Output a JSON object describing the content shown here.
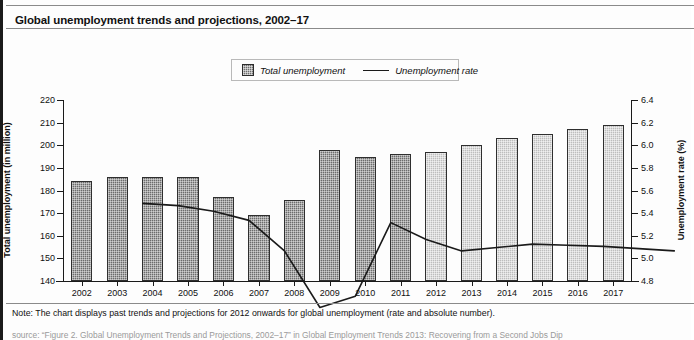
{
  "chart_title": "Global unemployment trends and projections, 2002–17",
  "legend": {
    "bar_label": "Total unemployment",
    "line_label": "Unemployment rate"
  },
  "footer": {
    "note": "Note: The chart displays past trends and projections for 2012 onwards for global unemployment (rate and absolute number).",
    "source": "source: “Figure 2. Global Unemployment Trends and Projections, 2002–17” in Global Employment Trends 2013: Recovering from a Second Jobs Dip"
  },
  "colors": {
    "bar_past": "#6c6c6c",
    "bar_projection": "#bdbdbd",
    "line": "#1a1a1a",
    "axis": "#1a1a1a",
    "title_text": "#111111"
  },
  "chart_data": {
    "type": "bar",
    "title": "Global unemployment trends and projections, 2002–17",
    "xlabel": "",
    "ylabel": "Total unemployment (in million)",
    "y2label": "Unemployment rate (%)",
    "ylim": [
      140,
      220
    ],
    "yticks": [
      140,
      150,
      160,
      170,
      180,
      190,
      200,
      210,
      220
    ],
    "y2lim": [
      4.8,
      6.4
    ],
    "y2ticks": [
      4.8,
      5.0,
      5.2,
      5.4,
      5.6,
      5.8,
      6.0,
      6.2,
      6.4
    ],
    "grid": false,
    "legend_position": "top-center",
    "categories": [
      "2002",
      "2003",
      "2004",
      "2005",
      "2006",
      "2007",
      "2008",
      "2009",
      "2010",
      "2011",
      "2012",
      "2013",
      "2014",
      "2015",
      "2016",
      "2017"
    ],
    "series": [
      {
        "name": "Total unemployment",
        "type": "bar",
        "axis": "left",
        "unit": "million",
        "values": [
          184,
          186,
          186,
          186,
          177,
          169,
          176,
          198,
          195,
          196,
          197,
          200,
          203,
          205,
          207,
          209
        ],
        "projection_from": "2012"
      },
      {
        "name": "Unemployment rate",
        "type": "line",
        "axis": "right",
        "unit": "%",
        "values": [
          6.37,
          6.35,
          6.3,
          6.22,
          5.95,
          5.45,
          5.55,
          6.2,
          6.05,
          5.95,
          5.98,
          6.01,
          6.0,
          5.99,
          5.97,
          5.95
        ],
        "projection_from": "2012"
      }
    ],
    "annotations": [
      "Note: The chart displays past trends and projections for 2012 onwards for global unemployment (rate and absolute number)."
    ]
  }
}
